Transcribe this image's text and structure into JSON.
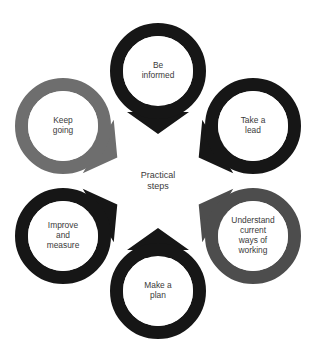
{
  "diagram": {
    "type": "cycle-hub-and-spoke",
    "background_color": "#ffffff",
    "hub": {
      "label_line1": "Practical",
      "label_line2": "steps",
      "fill_color": "#ffffff",
      "text_color": "#3a3a3a",
      "center_x": 158,
      "center_y": 181,
      "radius": 45
    },
    "geometry": {
      "orbit_radius": 110,
      "ring_outer_radius": 48,
      "ring_band_thickness": 13,
      "arrow_half_width": 19
    },
    "colors": {
      "black": "#161616",
      "gray_light": "#6e6e6e",
      "gray_dark": "#4d4d4d",
      "text": "#3a3a3a",
      "white": "#ffffff"
    },
    "nodes": [
      {
        "id": "be-informed",
        "name": "be-informed",
        "lines": [
          "Be",
          "informed"
        ],
        "color": "#161616",
        "angle_deg": -90,
        "cx": 158,
        "cy": 71
      },
      {
        "id": "take-a-lead",
        "name": "take-a-lead",
        "lines": [
          "Take a",
          "lead"
        ],
        "color": "#161616",
        "angle_deg": -30,
        "cx": 253,
        "cy": 126
      },
      {
        "id": "understand-current-ways-of-working",
        "name": "understand-current-ways-of-working",
        "lines": [
          "Understand",
          "current",
          "ways of",
          "working"
        ],
        "color": "#4d4d4d",
        "angle_deg": 30,
        "cx": 253,
        "cy": 236
      },
      {
        "id": "make-a-plan",
        "name": "make-a-plan",
        "lines": [
          "Make a",
          "plan"
        ],
        "color": "#161616",
        "angle_deg": 90,
        "cx": 158,
        "cy": 291
      },
      {
        "id": "improve-and-measure",
        "name": "improve-and-measure",
        "lines": [
          "Improve",
          "and",
          "measure"
        ],
        "color": "#161616",
        "angle_deg": 150,
        "cx": 63,
        "cy": 236
      },
      {
        "id": "keep-going",
        "name": "keep-going",
        "lines": [
          "Keep",
          "going"
        ],
        "color": "#6e6e6e",
        "angle_deg": 210,
        "cx": 63,
        "cy": 126
      }
    ]
  }
}
